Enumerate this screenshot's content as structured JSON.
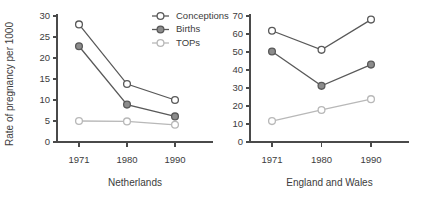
{
  "chart_data": {
    "type": "line",
    "title": "",
    "ylabel": "Rate of pregnancy per 1000",
    "xlabel": "",
    "grid": false,
    "legend_position": "top-center",
    "legend": [
      "Conceptions",
      "Births",
      "TOPs"
    ],
    "series_styles": [
      {
        "name": "Conceptions",
        "marker": "open-circle",
        "color": "#595959",
        "marker_fill": "#ffffff"
      },
      {
        "name": "Births",
        "marker": "filled-circle",
        "color": "#595959",
        "marker_fill": "#8c8c8c"
      },
      {
        "name": "TOPs",
        "marker": "open-circle",
        "color": "#b8b8b8",
        "marker_fill": "#ffffff"
      }
    ],
    "panels": [
      {
        "caption": "Netherlands",
        "x": [
          1971,
          1980,
          1990
        ],
        "xticklabels": [
          "1971",
          "1980",
          "1990"
        ],
        "ylim": [
          0,
          30
        ],
        "yticks": [
          0,
          5,
          10,
          15,
          20,
          25,
          30
        ],
        "yticklabels": [
          "0",
          "5",
          "10",
          "15",
          "20",
          "25",
          "30"
        ],
        "series": [
          {
            "name": "Conceptions",
            "values": [
              28.0,
              13.8,
              10.0
            ]
          },
          {
            "name": "Births",
            "values": [
              22.8,
              8.9,
              6.1
            ]
          },
          {
            "name": "TOPs",
            "values": [
              5.0,
              4.9,
              4.1
            ]
          }
        ]
      },
      {
        "caption": "England and Wales",
        "x": [
          1971,
          1980,
          1990
        ],
        "xticklabels": [
          "1971",
          "1980",
          "1990"
        ],
        "ylim": [
          0,
          70
        ],
        "yticks": [
          0,
          10,
          20,
          30,
          40,
          50,
          60,
          70
        ],
        "yticklabels": [
          "0",
          "10",
          "20",
          "30",
          "40",
          "50",
          "60",
          "70"
        ],
        "series": [
          {
            "name": "Conceptions",
            "values": [
              61.8,
              51.2,
              68.0
            ]
          },
          {
            "name": "Births",
            "values": [
              50.3,
              31.2,
              43.0
            ]
          },
          {
            "name": "TOPs",
            "values": [
              11.6,
              17.8,
              23.8
            ]
          }
        ]
      }
    ]
  }
}
